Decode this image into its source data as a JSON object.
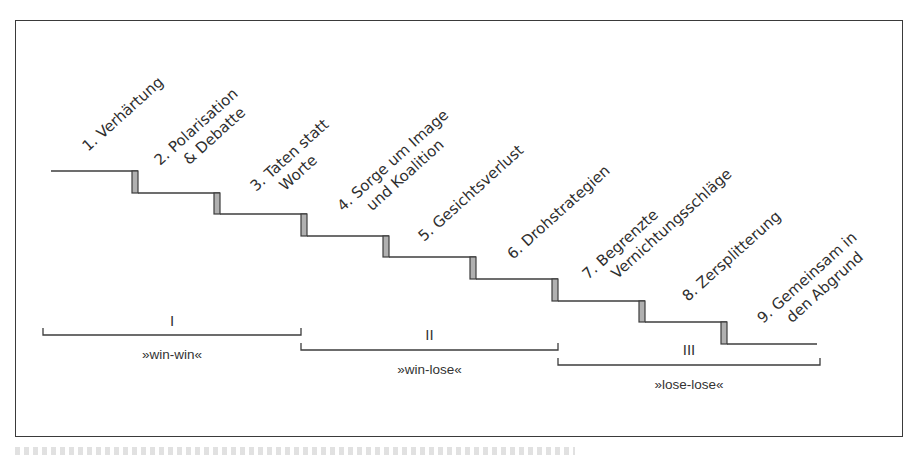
{
  "figure": {
    "frame": {
      "x": 15,
      "y": 20,
      "width": 888,
      "height": 417
    },
    "colors": {
      "line": "#3c3c3c",
      "riser_fill": "#b0b0b0",
      "text": "#2e2e2e",
      "background": "#ffffff"
    },
    "label_rotation_deg": -42
  },
  "staircase": {
    "start_x": 51,
    "end_x": 817,
    "riser_width": 6,
    "steps": [
      {
        "tread_from": 51,
        "tread_to": 132,
        "y": 171
      },
      {
        "tread_from": 138,
        "tread_to": 214,
        "y": 193
      },
      {
        "tread_from": 220,
        "tread_to": 301,
        "y": 214
      },
      {
        "tread_from": 307,
        "tread_to": 383,
        "y": 236
      },
      {
        "tread_from": 389,
        "tread_to": 470,
        "y": 257
      },
      {
        "tread_from": 476,
        "tread_to": 552,
        "y": 279
      },
      {
        "tread_from": 558,
        "tread_to": 639,
        "y": 301
      },
      {
        "tread_from": 645,
        "tread_to": 721,
        "y": 322
      },
      {
        "tread_from": 727,
        "tread_to": 817,
        "y": 344
      }
    ]
  },
  "stages": [
    {
      "number": "1.",
      "lines": [
        "1. Verhärtung"
      ],
      "anchor_x": 88,
      "anchor_y": 152
    },
    {
      "number": "2.",
      "lines": [
        "2. Polarisation",
        "& Debatte"
      ],
      "anchor_x": 160,
      "anchor_y": 166
    },
    {
      "number": "3.",
      "lines": [
        "3. Taten statt",
        "Worte"
      ],
      "anchor_x": 256,
      "anchor_y": 192
    },
    {
      "number": "4.",
      "lines": [
        "4. Sorge um Image",
        "und Koalition"
      ],
      "anchor_x": 343,
      "anchor_y": 212
    },
    {
      "number": "5.",
      "lines": [
        "5. Gesichtsverlust"
      ],
      "anchor_x": 424,
      "anchor_y": 242
    },
    {
      "number": "6.",
      "lines": [
        "6. Drohstrategien"
      ],
      "anchor_x": 513,
      "anchor_y": 260
    },
    {
      "number": "7.",
      "lines": [
        "7. Begrenzte",
        "Vernichtungsschläge"
      ],
      "anchor_x": 588,
      "anchor_y": 280
    },
    {
      "number": "8.",
      "lines": [
        "8. Zersplitterung"
      ],
      "anchor_x": 688,
      "anchor_y": 302
    },
    {
      "number": "9.",
      "lines": [
        "9. Gemeinsam in",
        "den Abgrund"
      ],
      "anchor_x": 763,
      "anchor_y": 324
    }
  ],
  "phases": [
    {
      "numeral": "I",
      "type": "»win-win«",
      "x1": 43,
      "x2": 301,
      "bracket_y": 335,
      "numeral_y": 326,
      "type_y": 359
    },
    {
      "numeral": "II",
      "type": "»win-lose«",
      "x1": 301,
      "x2": 558,
      "bracket_y": 350,
      "numeral_y": 340,
      "type_y": 374
    },
    {
      "numeral": "III",
      "type": "»lose-lose«",
      "x1": 558,
      "x2": 820,
      "bracket_y": 365,
      "numeral_y": 355,
      "type_y": 389
    }
  ]
}
